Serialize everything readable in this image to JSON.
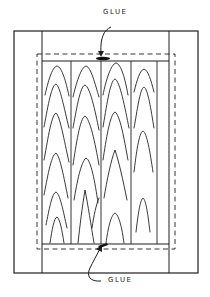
{
  "diagram": {
    "title": "",
    "labels": {
      "top_glue": "GLUE",
      "bottom_glue": "GLUE"
    },
    "colors": {
      "line": "#1e1e1e",
      "background": "#ffffff"
    },
    "frame": {
      "outer": {
        "x": 14,
        "y": 31,
        "w": 184,
        "h": 242
      },
      "left_stile_x": 42,
      "right_stile_x": 169,
      "top_rail_y": 61,
      "bottom_rail_y": 244
    },
    "dashed_outline": {
      "x": 37,
      "y": 54,
      "w": 138,
      "h": 195
    },
    "panel_boards": [
      {
        "x0": 43,
        "x1": 71
      },
      {
        "x0": 71,
        "x1": 101
      },
      {
        "x0": 101,
        "x1": 131
      },
      {
        "x0": 131,
        "x1": 156
      }
    ],
    "callouts": [
      {
        "label": "GLUE",
        "position": "top",
        "points_to": "top rail joint"
      },
      {
        "label": "GLUE",
        "position": "bottom",
        "points_to": "bottom rail joint"
      }
    ]
  }
}
